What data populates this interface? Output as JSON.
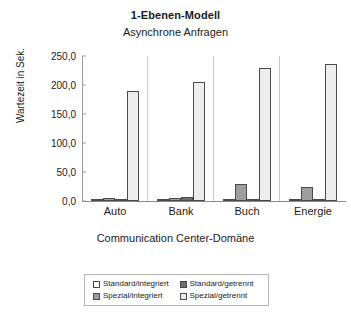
{
  "chart_data": {
    "type": "bar",
    "title": "1-Ebenen-Modell",
    "subtitle": "Asynchrone Anfragen",
    "xlabel": "Communication Center-Domäne",
    "ylabel": "Wartezeit in Sek.",
    "categories": [
      "Auto",
      "Bank",
      "Buch",
      "Energie"
    ],
    "ylim": [
      0,
      250
    ],
    "yticks": [
      "0,0",
      "50,0",
      "100,0",
      "150,0",
      "200,0",
      "250,0"
    ],
    "ytick_values": [
      0,
      50,
      100,
      150,
      200,
      250
    ],
    "grid": false,
    "legend_position": "bottom",
    "series": [
      {
        "name": "Standard/integriert",
        "values": [
          1.0,
          1.0,
          1.5,
          1.5
        ],
        "color": "#ffffff"
      },
      {
        "name": "Spezial/integriert",
        "values": [
          6.0,
          5.5,
          29.0,
          24.0
        ],
        "color": "#9e9e9e"
      },
      {
        "name": "Standard/getrennt",
        "values": [
          2.5,
          7.5,
          3.5,
          3.0
        ],
        "color": "#6f6f6f"
      },
      {
        "name": "Spezial/getrennt",
        "values": [
          190.0,
          205.0,
          229.0,
          236.0
        ],
        "color": "#ededed"
      }
    ],
    "legend_order": [
      "Standard/integriert",
      "Standard/getrennt",
      "Spezial/integriert",
      "Spezial/getrennt"
    ]
  }
}
